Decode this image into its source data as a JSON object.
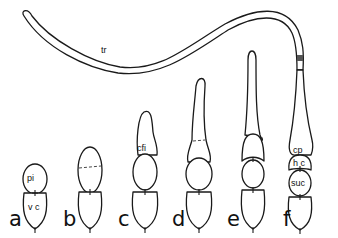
{
  "figure": {
    "stage_labels": [
      "a",
      "b",
      "c",
      "d",
      "e",
      "f"
    ],
    "structure_labels": {
      "pi": "pi",
      "vc": "v c",
      "cfi": "cfi",
      "cp": "cp",
      "hc": "h c",
      "suc": "suc",
      "tr": "tr"
    },
    "colors": {
      "line": "#1a1a1a",
      "background": "#ffffff",
      "band": "#555555"
    }
  }
}
